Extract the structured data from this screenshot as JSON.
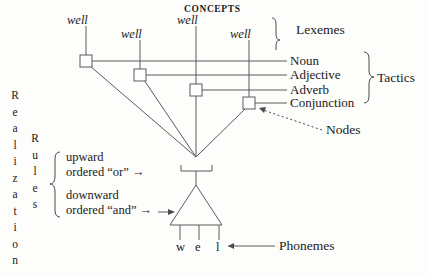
{
  "figure": {
    "title_top": "CONCEPTS",
    "lexemes": [
      {
        "id": "lex-1",
        "text": "well"
      },
      {
        "id": "lex-2",
        "text": "well"
      },
      {
        "id": "lex-3",
        "text": "well"
      },
      {
        "id": "lex-4",
        "text": "well"
      }
    ],
    "stratum_labels": {
      "lexemes": "Lexemes",
      "tactics": "Tactics",
      "nodes": "Nodes",
      "phonemes": "Phonemes"
    },
    "categories": [
      {
        "id": "cat-noun",
        "label": "Noun"
      },
      {
        "id": "cat-adjective",
        "label": "Adjective"
      },
      {
        "id": "cat-adverb",
        "label": "Adverb"
      },
      {
        "id": "cat-conjunction",
        "label": "Conjunction"
      }
    ],
    "left_vertical": {
      "word_1": "Realization",
      "word_1_letters": [
        "R",
        "e",
        "a",
        "l",
        "i",
        "z",
        "a",
        "t",
        "i",
        "o",
        "n"
      ],
      "word_2": "Rules",
      "word_2_letters": [
        "R",
        "u",
        "l",
        "e",
        "s"
      ]
    },
    "rules": [
      {
        "id": "rule-or",
        "line1": "upward",
        "line2": "ordered “or” →"
      },
      {
        "id": "rule-and",
        "line1": "downward",
        "line2": "ordered “and” →"
      }
    ],
    "phonemes": [
      {
        "id": "ph-w",
        "symbol": "w"
      },
      {
        "id": "ph-e",
        "symbol": "e"
      },
      {
        "id": "ph-l",
        "symbol": "l"
      }
    ],
    "colors": {
      "ink": "#1a1a1a",
      "line": "#4a4a4a",
      "paper": "#fdfdfb"
    }
  }
}
